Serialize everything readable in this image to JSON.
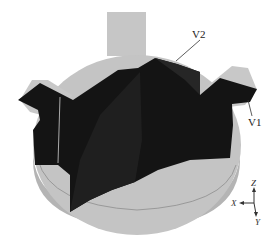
{
  "figure": {
    "labels": {
      "v1": "V1",
      "v2": "V2"
    },
    "axes": {
      "z": "Z",
      "x": "X",
      "y": "Y"
    },
    "colors": {
      "base_gray": "#c3c3c3",
      "base_rim": "#a9a9a9",
      "solid_dark": "#141414",
      "solid_mid": "#222222"
    }
  }
}
